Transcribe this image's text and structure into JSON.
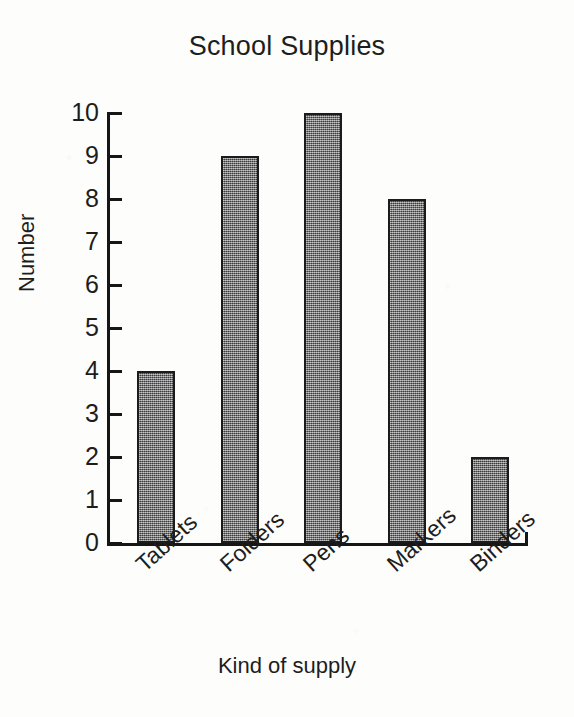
{
  "chart_data": {
    "type": "bar",
    "title": "School Supplies",
    "xlabel": "Kind of supply",
    "ylabel": "Number",
    "categories": [
      "Tablets",
      "Folders",
      "Pens",
      "Markers",
      "Binders"
    ],
    "values": [
      4,
      9,
      10,
      8,
      2
    ],
    "ylim": [
      0,
      10
    ],
    "y_ticks": [
      10,
      9,
      8,
      7,
      6,
      5,
      4,
      3,
      2,
      1,
      0
    ],
    "y_tick_labels": [
      "10",
      "9",
      "8",
      "7",
      "6",
      "5",
      "4",
      "3",
      "2",
      "1",
      "0"
    ],
    "y_tick_interval": 1,
    "grid": false,
    "legend": false,
    "bar_fill_color": "#6d6d6d",
    "bar_border_color": "#1b1b1b",
    "axis_color": "#161616",
    "text_color": "#1d1d1d",
    "background_color": "#fdfdfc",
    "category_label_rotation": -42,
    "tick_direction": "inward"
  }
}
